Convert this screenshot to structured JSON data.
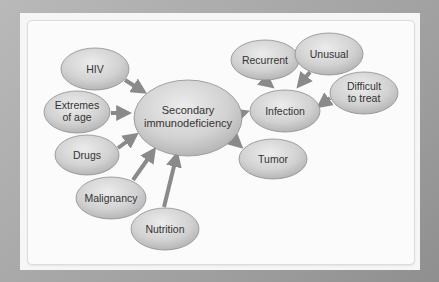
{
  "diagram": {
    "title": "",
    "colors": {
      "node_fill_center": "#e6e6e6",
      "node_fill_edge": "#b4b4b4",
      "node_stroke": "#8e8e8e",
      "arrow": "#8a8a8a",
      "text": "#333333"
    },
    "nodes": {
      "hiv": {
        "lines": [
          "HIV"
        ]
      },
      "extremes": {
        "lines": [
          "Extremes",
          "of age"
        ]
      },
      "drugs": {
        "lines": [
          "Drugs"
        ]
      },
      "malignancy": {
        "lines": [
          "Malignancy"
        ]
      },
      "nutrition": {
        "lines": [
          "Nutrition"
        ]
      },
      "secondary": {
        "lines": [
          "Secondary",
          "immunodeficiency"
        ]
      },
      "recurrent": {
        "lines": [
          "Recurrent"
        ]
      },
      "unusual": {
        "lines": [
          "Unusual"
        ]
      },
      "difficult": {
        "lines": [
          "Difficult",
          "to treat"
        ]
      },
      "infection": {
        "lines": [
          "Infection"
        ]
      },
      "tumor": {
        "lines": [
          "Tumor"
        ]
      }
    },
    "edges": [
      {
        "from": "HIV",
        "to": "Secondary immunodeficiency"
      },
      {
        "from": "Extremes of age",
        "to": "Secondary immunodeficiency"
      },
      {
        "from": "Drugs",
        "to": "Secondary immunodeficiency"
      },
      {
        "from": "Malignancy",
        "to": "Secondary immunodeficiency"
      },
      {
        "from": "Nutrition",
        "to": "Secondary immunodeficiency"
      },
      {
        "from": "Secondary immunodeficiency",
        "to": "Infection"
      },
      {
        "from": "Secondary immunodeficiency",
        "to": "Tumor"
      },
      {
        "from": "Recurrent",
        "to": "Infection"
      },
      {
        "from": "Unusual",
        "to": "Infection"
      },
      {
        "from": "Difficult to treat",
        "to": "Infection"
      }
    ]
  }
}
